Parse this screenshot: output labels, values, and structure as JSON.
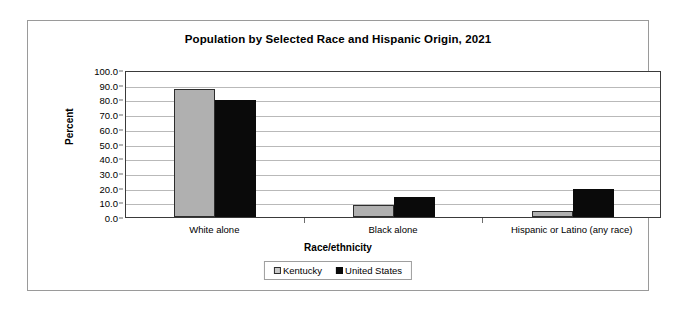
{
  "chart_data": {
    "type": "bar",
    "title": "Population by Selected Race and Hispanic Origin, 2021",
    "xlabel": "Race/ethnicity",
    "ylabel": "Percent",
    "categories": [
      "White alone",
      "Black alone",
      "Hispanic or Latino (any race)"
    ],
    "series": [
      {
        "name": "Kentucky",
        "color": "#b0b0b0",
        "values": [
          87.0,
          8.5,
          4.0
        ]
      },
      {
        "name": "United States",
        "color": "#0a0a0a",
        "values": [
          79.5,
          13.6,
          18.9
        ]
      }
    ],
    "ylim": [
      0,
      100
    ],
    "ytick_step": 10,
    "ytick_labels": [
      "0.0",
      "10.0",
      "20.0",
      "30.0",
      "40.0",
      "50.0",
      "60.0",
      "70.0",
      "80.0",
      "90.0",
      "100.0"
    ],
    "grid": true,
    "legend_position": "bottom"
  },
  "legend": {
    "items": [
      {
        "label": "Kentucky",
        "swatch": "gray-square-icon"
      },
      {
        "label": "United States",
        "swatch": "black-square-icon"
      }
    ]
  }
}
